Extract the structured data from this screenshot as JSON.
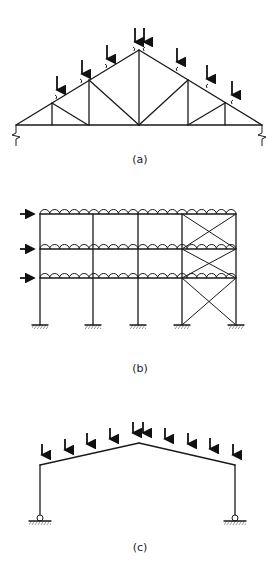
{
  "figure": {
    "panels": [
      {
        "id": "a",
        "label": "(a)",
        "description": "Pitched roof truss with top-chord point loads and end supports"
      },
      {
        "id": "b",
        "label": "(b)",
        "description": "Three-storey multi-bay frame with distributed floor loads, lateral loads and cross-bracing in right bay"
      },
      {
        "id": "c",
        "label": "(c)",
        "description": "Pitched portal frame with point loads on rafters and pinned bases"
      }
    ]
  },
  "colors": {
    "line": "#1a1a1a",
    "background": "#ffffff"
  }
}
